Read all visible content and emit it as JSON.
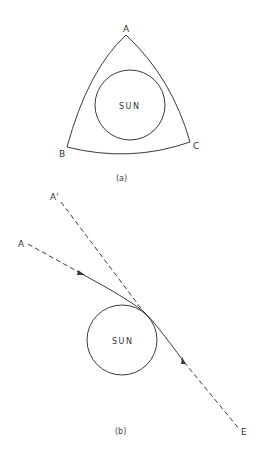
{
  "figure_a": {
    "caption": "(a)",
    "sun_label": "SUN",
    "vertices": {
      "A": "A",
      "B": "B",
      "C": "C"
    }
  },
  "figure_b": {
    "caption": "(b)",
    "sun_label": "SUN",
    "labels": {
      "A_prime": "A'",
      "A": "A",
      "E": "E"
    }
  },
  "colors": {
    "line": "#3a3a3a",
    "background": "#ffffff"
  }
}
